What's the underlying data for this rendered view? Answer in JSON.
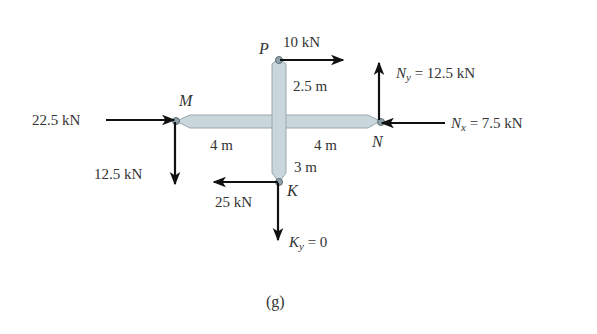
{
  "figure": {
    "caption": "(g)",
    "member_color": "#c9d6dc",
    "member_outline": "#9aa8ae",
    "arrow_color": "#111111",
    "points": {
      "P": "P",
      "M": "M",
      "N": "N",
      "K": "K"
    },
    "dimensions": {
      "P_to_center": "2.5 m",
      "M_to_center": "4 m",
      "center_to_N": "4 m",
      "center_to_K": "3 m"
    },
    "forces": {
      "P_horizontal": "10 kN",
      "M_horizontal": "22.5 kN",
      "M_vertical": "12.5 kN",
      "N_y_symbol": "N",
      "N_y_sub": "y",
      "N_y_value": " = 12.5 kN",
      "N_x_symbol": "N",
      "N_x_sub": "x",
      "N_x_value": " = 7.5 kN",
      "K_horizontal": "25 kN",
      "K_y_symbol": "K",
      "K_y_sub": "y",
      "K_y_value": " = 0"
    }
  }
}
